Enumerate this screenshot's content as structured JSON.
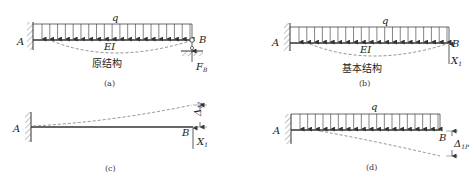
{
  "panels": [
    {
      "id": "a",
      "caption": "(a)",
      "title": "原结构",
      "load_label": "q",
      "stiffness_label": "EI",
      "left_label": "A",
      "right_label": "B",
      "reaction_label": "F",
      "reaction_sub": "B"
    },
    {
      "id": "b",
      "caption": "(b)",
      "title": "基本结构",
      "load_label": "q",
      "stiffness_label": "EI",
      "left_label": "A",
      "right_label": "B",
      "force_label": "X",
      "force_sub": "1"
    },
    {
      "id": "c",
      "caption": "(c)",
      "left_label": "A",
      "right_label": "B",
      "force_label": "X",
      "force_sub": "1",
      "displacement_label": "Δ",
      "displacement_sub": "11"
    },
    {
      "id": "d",
      "caption": "(d)",
      "load_label": "q",
      "left_label": "A",
      "right_label": "B",
      "displacement_label": "Δ",
      "displacement_sub": "1P"
    }
  ]
}
